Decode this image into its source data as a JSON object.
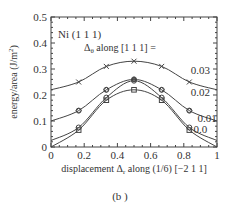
{
  "chart_data": {
    "type": "line",
    "title": "Ni (1 1 1)",
    "legend_title": "Δθ along [1 1 1] =",
    "xlabel": "displacement Δr along (1/6) [−2 1 1]",
    "ylabel": "energy/area (J/m²)",
    "xlim": [
      0,
      1
    ],
    "ylim": [
      0,
      0.5
    ],
    "xticks": [
      "0",
      "0.2",
      "0.4",
      "0.6",
      "0.8",
      "1"
    ],
    "yticks": [
      "0",
      "0.1",
      "0.2",
      "0.3",
      "0.4",
      "0.5"
    ],
    "grid": false,
    "x": [
      0,
      0.1667,
      0.3333,
      0.5,
      0.6667,
      0.8333,
      1.0
    ],
    "series": [
      {
        "name": "0.03",
        "marker": "x",
        "values": [
          0.22,
          0.25,
          0.31,
          0.33,
          0.31,
          0.25,
          0.22
        ]
      },
      {
        "name": "0.02",
        "marker": "diamond-circle",
        "values": [
          0.1,
          0.14,
          0.22,
          0.26,
          0.22,
          0.14,
          0.1
        ]
      },
      {
        "name": "0.01",
        "marker": "circle",
        "values": [
          0.025,
          0.075,
          0.19,
          0.255,
          0.19,
          0.075,
          0.025
        ]
      },
      {
        "name": "0.0",
        "marker": "square",
        "values": [
          0.0,
          0.065,
          0.18,
          0.22,
          0.18,
          0.065,
          0.0
        ]
      }
    ],
    "series_labels": [
      {
        "text": "0.03",
        "x": 0.9,
        "y": 0.28
      },
      {
        "text": "0.02",
        "x": 0.9,
        "y": 0.195
      },
      {
        "text": "0.01",
        "x": 0.94,
        "y": 0.095
      },
      {
        "text": "0.0",
        "x": 0.9,
        "y": 0.055
      }
    ],
    "caption": "(b )"
  }
}
